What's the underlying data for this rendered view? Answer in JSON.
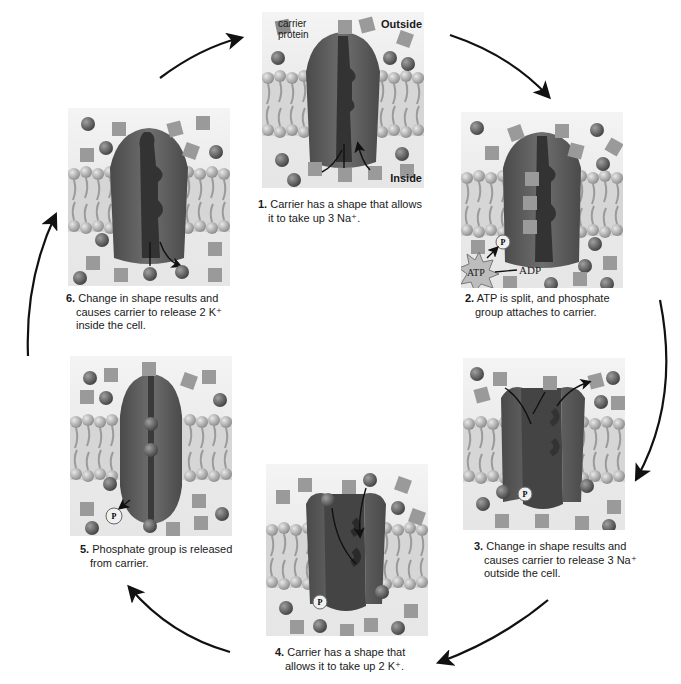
{
  "diagram": {
    "labels": {
      "carrier_protein": "carrier protein",
      "outside": "Outside",
      "inside": "Inside",
      "atp": "ATP",
      "adp": "ADP",
      "phosphate": "P",
      "sodium_ion": "Na⁺",
      "potassium_ion": "K⁺"
    },
    "steps": [
      {
        "num": "1.",
        "line1": "Carrier has a shape that allows",
        "line2": "it to take up 3 Na⁺.",
        "line3": ""
      },
      {
        "num": "2.",
        "line1": "ATP is split, and phosphate",
        "line2": "group attaches to carrier.",
        "line3": ""
      },
      {
        "num": "3.",
        "line1": "Change in shape results and",
        "line2": "causes carrier to release 3 Na⁺",
        "line3": "outside the cell."
      },
      {
        "num": "4.",
        "line1": "Carrier has a shape that",
        "line2": "allows it to take up 2 K⁺.",
        "line3": ""
      },
      {
        "num": "5.",
        "line1": "Phosphate group is released",
        "line2": "from carrier.",
        "line3": ""
      },
      {
        "num": "6.",
        "line1": "Change in shape results and",
        "line2": "causes carrier to release 2 K⁺",
        "line3": "inside the cell."
      }
    ],
    "colors": {
      "protein": "#5a5a5a",
      "protein_dark": "#3a3a3a",
      "membrane": "#b8b8b8",
      "arrow": "#111111",
      "background": "#ffffff"
    }
  }
}
